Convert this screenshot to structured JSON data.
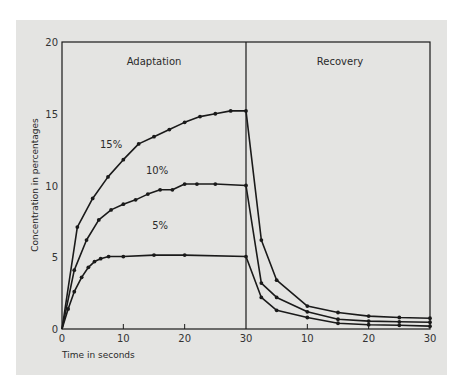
{
  "chart_data": {
    "type": "line",
    "title": "",
    "xlabel": "Time in seconds",
    "ylabel": "Concentration in percentages",
    "ylim": [
      0,
      20
    ],
    "yticks": [
      0,
      5,
      10,
      15,
      20
    ],
    "grid": false,
    "legend": "inline labels",
    "panels": [
      {
        "name": "Adaptation",
        "xlim": [
          0,
          30
        ],
        "xticks": [
          0,
          10,
          20,
          30
        ]
      },
      {
        "name": "Recovery",
        "xlim": [
          0,
          30
        ],
        "xticks": [
          10,
          20,
          30
        ]
      }
    ],
    "series": [
      {
        "name": "15%",
        "adaptation": {
          "x": [
            0,
            2.5,
            5,
            7.5,
            10,
            12.5,
            15,
            17.5,
            20,
            22.5,
            25,
            27.5,
            30
          ],
          "y": [
            0,
            7.1,
            9.1,
            10.6,
            11.8,
            12.9,
            13.4,
            13.9,
            14.4,
            14.8,
            15.0,
            15.2,
            15.2
          ]
        },
        "recovery": {
          "x": [
            0,
            2.5,
            5,
            10,
            15,
            20,
            25,
            30
          ],
          "y": [
            15.2,
            6.2,
            3.4,
            1.6,
            1.15,
            0.9,
            0.8,
            0.75
          ]
        }
      },
      {
        "name": "10%",
        "adaptation": {
          "x": [
            0,
            2,
            4,
            6,
            8,
            10,
            12,
            14,
            16,
            18,
            20,
            22,
            25,
            30
          ],
          "y": [
            0,
            4.1,
            6.2,
            7.6,
            8.3,
            8.7,
            9.0,
            9.4,
            9.7,
            9.7,
            10.1,
            10.1,
            10.1,
            10.0
          ]
        },
        "recovery": {
          "x": [
            0,
            2.5,
            5,
            10,
            15,
            20,
            25,
            30
          ],
          "y": [
            10.0,
            3.2,
            2.2,
            1.2,
            0.68,
            0.55,
            0.5,
            0.47
          ]
        }
      },
      {
        "name": "5%",
        "adaptation": {
          "x": [
            0,
            1,
            2,
            3.2,
            4.3,
            5.3,
            6.3,
            7.6,
            10,
            15,
            20,
            30
          ],
          "y": [
            0,
            1.4,
            2.6,
            3.6,
            4.3,
            4.7,
            4.9,
            5.05,
            5.05,
            5.15,
            5.15,
            5.05
          ]
        },
        "recovery": {
          "x": [
            0,
            2.5,
            5,
            10,
            15,
            20,
            25,
            30
          ],
          "y": [
            5.05,
            2.2,
            1.3,
            0.8,
            0.4,
            0.3,
            0.26,
            0.2
          ]
        }
      }
    ],
    "annotations": [
      {
        "text": "15%",
        "x": 8,
        "y": 12.6,
        "panel": "Adaptation"
      },
      {
        "text": "10%",
        "x": 15.5,
        "y": 10.8,
        "panel": "Adaptation"
      },
      {
        "text": "5%",
        "x": 16,
        "y": 7.0,
        "panel": "Adaptation"
      }
    ]
  },
  "labels": {
    "adaptation": "Adaptation",
    "recovery": "Recovery",
    "xlabel": "Time in seconds",
    "ylabel": "Concentration in percentages"
  },
  "colors": {
    "background": "#e4e4e2",
    "line": "#1a1a1a"
  }
}
